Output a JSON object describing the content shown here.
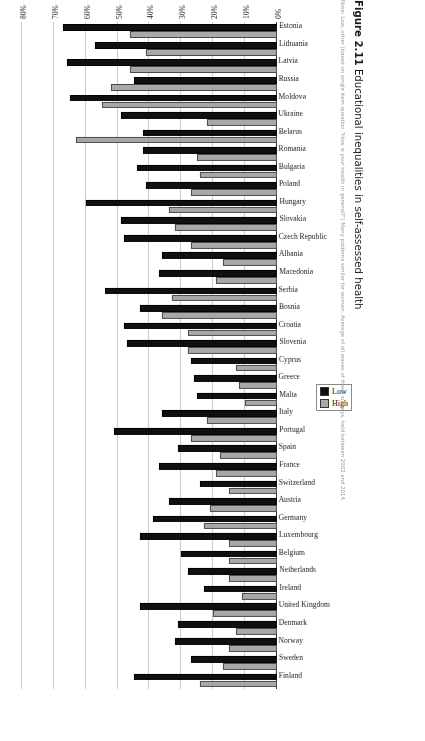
{
  "figure": {
    "number_label": "Figure 2.11",
    "caption": "Educational inequalities in self-assessed health",
    "note": "Note: Low, other (based on single item question \"How is your health in general?\") Many patterns similar for women. Average of all waves of these surveys, held between 2002 and 2014."
  },
  "legend": {
    "position": "right-middle",
    "items": [
      {
        "label": "Low",
        "color": "#101010"
      },
      {
        "label": "High",
        "color": "#a8a8a8"
      }
    ]
  },
  "axis": {
    "value_axis_title": "Age-standardized prevalence",
    "tick_labels": [
      "0%",
      "10%",
      "20%",
      "30%",
      "40%",
      "50%",
      "60%",
      "70%",
      "80%"
    ]
  },
  "chart_data": {
    "type": "bar",
    "orientation": "horizontal",
    "title": "Educational inequalities in self-assessed health",
    "xlabel": "Age-standardized prevalence",
    "ylabel": "",
    "xlim": [
      0,
      80
    ],
    "grid": true,
    "legend_position": "right",
    "categories": [
      "Finland",
      "Sweden",
      "Norway",
      "Denmark",
      "United Kingdom",
      "Ireland",
      "Netherlands",
      "Belgium",
      "Luxembourg",
      "Germany",
      "Austria",
      "Switzerland",
      "France",
      "Spain",
      "Portugal",
      "Italy",
      "Malta",
      "Greece",
      "Cyprus",
      "Slovenia",
      "Croatia",
      "Bosnia",
      "Serbia",
      "Macedonia",
      "Albania",
      "Czech Republic",
      "Slovakia",
      "Hungary",
      "Poland",
      "Bulgaria",
      "Romania",
      "Belarus",
      "Ukraine",
      "Moldova",
      "Russia",
      "Latvia",
      "Lithuania",
      "Estonia"
    ],
    "series": [
      {
        "name": "Low",
        "color": "#101010",
        "values": [
          45,
          27,
          32,
          31,
          43,
          23,
          28,
          30,
          43,
          39,
          34,
          24,
          37,
          31,
          51,
          36,
          25,
          26,
          27,
          47,
          48,
          43,
          54,
          37,
          36,
          48,
          49,
          60,
          41,
          44,
          42,
          42,
          49,
          65,
          45,
          66,
          57,
          67
        ]
      },
      {
        "name": "High",
        "color": "#a8a8a8",
        "values": [
          24,
          17,
          15,
          13,
          20,
          11,
          15,
          15,
          15,
          23,
          21,
          15,
          19,
          18,
          27,
          22,
          10,
          12,
          13,
          28,
          28,
          36,
          33,
          19,
          17,
          27,
          32,
          34,
          27,
          24,
          25,
          63,
          22,
          55,
          52,
          46,
          41,
          46
        ]
      }
    ]
  }
}
